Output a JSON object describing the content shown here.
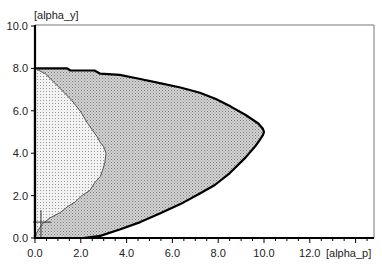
{
  "chart_data": {
    "type": "area",
    "title": "",
    "xlabel": "[alpha_p]",
    "ylabel": "[alpha_y]",
    "xlim": [
      0,
      14.6
    ],
    "ylim": [
      0,
      10
    ],
    "grid": false,
    "legend": null,
    "x_ticks": [
      "0.0",
      "2.0",
      "4.0",
      "6.0",
      "8.0",
      "10.0",
      "12.0"
    ],
    "y_ticks": [
      "0.0",
      "2.0",
      "4.0",
      "6.0",
      "8.0",
      "10.0"
    ],
    "x_tick_values": [
      0,
      2,
      4,
      6,
      8,
      10,
      12
    ],
    "y_tick_values": [
      0,
      2,
      4,
      6,
      8,
      10
    ],
    "minor_x_step": 0.5,
    "series": [
      {
        "name": "outer-region",
        "fill": "#c8c8c8",
        "stroke": "#000000",
        "points": [
          [
            0,
            8.0
          ],
          [
            1.4,
            8.0
          ],
          [
            1.55,
            7.9
          ],
          [
            2.6,
            7.9
          ],
          [
            2.85,
            7.75
          ],
          [
            3.7,
            7.7
          ],
          [
            4.6,
            7.5
          ],
          [
            5.45,
            7.3
          ],
          [
            6.35,
            7.1
          ],
          [
            7.2,
            6.85
          ],
          [
            7.9,
            6.55
          ],
          [
            8.55,
            6.2
          ],
          [
            9.2,
            5.8
          ],
          [
            9.75,
            5.4
          ],
          [
            9.95,
            5.15
          ],
          [
            10.0,
            5.0
          ],
          [
            9.95,
            4.85
          ],
          [
            9.8,
            4.6
          ],
          [
            9.6,
            4.3
          ],
          [
            9.2,
            3.8
          ],
          [
            8.5,
            3.05
          ],
          [
            7.85,
            2.5
          ],
          [
            7.2,
            2.1
          ],
          [
            6.35,
            1.6
          ],
          [
            5.45,
            1.15
          ],
          [
            4.6,
            0.75
          ],
          [
            3.7,
            0.4
          ],
          [
            2.85,
            0.1
          ],
          [
            2.1,
            0.0
          ],
          [
            0,
            0
          ]
        ]
      },
      {
        "name": "inner-region",
        "fill": "#ebebeb",
        "stroke": "#555555",
        "points": [
          [
            0,
            8.0
          ],
          [
            0.45,
            7.75
          ],
          [
            1.1,
            7.05
          ],
          [
            1.6,
            6.5
          ],
          [
            2.0,
            5.95
          ],
          [
            2.3,
            5.4
          ],
          [
            2.7,
            4.8
          ],
          [
            2.85,
            4.5
          ],
          [
            3.0,
            4.3
          ],
          [
            3.1,
            4.0
          ],
          [
            3.05,
            3.55
          ],
          [
            2.95,
            3.2
          ],
          [
            2.85,
            2.9
          ],
          [
            2.6,
            2.6
          ],
          [
            2.4,
            2.25
          ],
          [
            2.05,
            2.0
          ],
          [
            1.75,
            1.7
          ],
          [
            1.45,
            1.5
          ],
          [
            1.1,
            1.2
          ],
          [
            0.65,
            0.95
          ],
          [
            0.3,
            0.65
          ],
          [
            0.05,
            0.2
          ],
          [
            0,
            0
          ]
        ]
      }
    ],
    "annotations": [
      {
        "type": "crosshair-marker",
        "x": 0.26,
        "y": 0.75
      }
    ]
  },
  "layout": {
    "x0_px": 35,
    "px_per_x": 22.9,
    "y0_px": 238,
    "px_per_y": 21.2,
    "frame_right_px": 374,
    "frame_top_px": 25
  }
}
